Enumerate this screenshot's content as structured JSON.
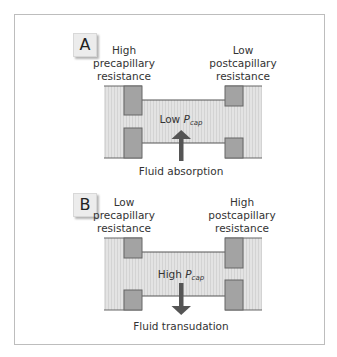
{
  "figure": {
    "colors": {
      "frame_border": "#bdbdbd",
      "vessel_fill": "#e0e0e0",
      "vessel_stripe": "#d2d2d2",
      "sphincter_fill": "#a3a3a3",
      "sphincter_stroke": "#666666",
      "vessel_line": "#555555",
      "arrow": "#555555",
      "label_box": "#ececec"
    },
    "panels": [
      {
        "id": "A",
        "label": "A",
        "left_header": [
          "High",
          "precapillary",
          "resistance"
        ],
        "right_header": [
          "Low",
          "postcapillary",
          "resistance"
        ],
        "pcap_prefix": "Low ",
        "pcap_symbol": "P",
        "pcap_subscript": "cap",
        "arrow_direction": "up",
        "caption": "Fluid absorption"
      },
      {
        "id": "B",
        "label": "B",
        "left_header": [
          "Low",
          "precapillary",
          "resistance"
        ],
        "right_header": [
          "High",
          "postcapillary",
          "resistance"
        ],
        "pcap_prefix": "High ",
        "pcap_symbol": "P",
        "pcap_subscript": "cap",
        "arrow_direction": "down",
        "caption": "Fluid transudation"
      }
    ]
  }
}
